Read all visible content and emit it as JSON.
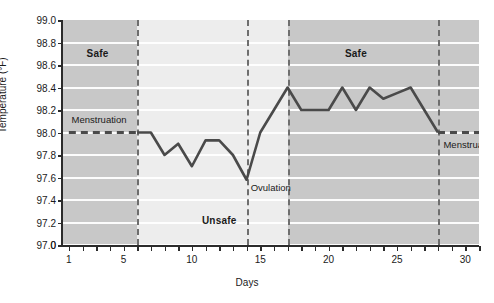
{
  "chart_data": {
    "type": "line",
    "title": "",
    "xlabel": "Days",
    "ylabel": "Temperature (°F)",
    "xlim": [
      0.5,
      31
    ],
    "ylim": [
      97.0,
      99.0
    ],
    "grid": true,
    "legend": "none",
    "y_axis_break_label": "0",
    "ytick_labels": [
      "99.0",
      "98.8",
      "98.6",
      "98.4",
      "98.2",
      "98.0",
      "97.8",
      "97.6",
      "97.4",
      "97.2",
      "97.0",
      "0"
    ],
    "ytick_values": [
      99.0,
      98.8,
      98.6,
      98.4,
      98.2,
      98.0,
      97.8,
      97.6,
      97.4,
      97.2,
      97.0
    ],
    "xtick_labels": [
      "1",
      "5",
      "10",
      "15",
      "20",
      "25",
      "30"
    ],
    "xtick_values": [
      1,
      5,
      10,
      15,
      20,
      25,
      30
    ],
    "x": [
      1,
      2,
      3,
      4,
      5,
      6,
      7,
      8,
      9,
      10,
      11,
      12,
      13,
      14,
      15,
      16,
      17,
      18,
      19,
      20,
      21,
      22,
      23,
      24,
      25,
      26,
      27,
      28,
      29,
      30,
      31
    ],
    "series": [
      {
        "name": "Basal body temperature",
        "style": "dashed",
        "segment": "menstruation-start",
        "x": [
          1,
          2,
          3,
          4,
          5,
          6
        ],
        "values": [
          98.0,
          98.0,
          98.0,
          98.0,
          98.0,
          98.0
        ]
      },
      {
        "name": "Basal body temperature",
        "style": "solid",
        "segment": "cycle",
        "x": [
          6,
          7,
          8,
          9,
          10,
          11,
          12,
          13,
          14,
          15,
          16,
          17,
          18,
          19,
          20,
          21,
          22,
          23,
          24,
          25,
          26,
          27,
          28
        ],
        "values": [
          98.0,
          98.0,
          97.8,
          97.9,
          97.7,
          97.93,
          97.93,
          97.8,
          97.58,
          98.0,
          98.2,
          98.4,
          98.2,
          98.2,
          98.2,
          98.4,
          98.2,
          98.4,
          98.3,
          98.35,
          98.4,
          98.2,
          98.0
        ]
      },
      {
        "name": "Basal body temperature",
        "style": "dashed",
        "segment": "menstruation-end",
        "x": [
          28,
          29,
          30,
          31
        ],
        "values": [
          98.0,
          98.0,
          98.0,
          98.0
        ]
      }
    ],
    "phase_bands": [
      {
        "label": "Safe",
        "x_start": 0.5,
        "x_end": 6.0,
        "shade": "dark",
        "color": "#c8c8c8"
      },
      {
        "label": "Unsafe",
        "x_start": 6.0,
        "x_end": 17.0,
        "shade": "light",
        "color": "#ededed"
      },
      {
        "label": "Safe",
        "x_start": 17.0,
        "x_end": 31.0,
        "shade": "dark",
        "color": "#c8c8c8"
      }
    ],
    "dividers": [
      {
        "name": "divider-day-6",
        "x": 6.0
      },
      {
        "name": "divider-day-14",
        "x": 14.0
      },
      {
        "name": "divider-day-17",
        "x": 17.0
      },
      {
        "name": "divider-day-28",
        "x": 28.0
      }
    ],
    "annotations": [
      {
        "name": "menstruation-start-label",
        "text": "Menstruation",
        "x": 1.2,
        "y": 98.12
      },
      {
        "name": "ovulation-label",
        "text": "Ovulation",
        "x": 14.3,
        "y": 97.52
      },
      {
        "name": "menstruation-end-label",
        "text": "Menstruation",
        "x": 28.4,
        "y": 97.9
      }
    ],
    "band_labels": [
      {
        "name": "band-label-safe-left",
        "text": "Safe",
        "x": 3.1,
        "y": 98.71
      },
      {
        "name": "band-label-unsafe",
        "text": "Unsafe",
        "x": 12.0,
        "y": 97.22
      },
      {
        "name": "band-label-safe-right",
        "text": "Safe",
        "x": 22.0,
        "y": 98.71
      }
    ],
    "colors": {
      "line": "#4a4a4a",
      "band_dark": "#c8c8c8",
      "band_light": "#ededed",
      "gridline": "#ffffff",
      "divider": "#6e6e6e",
      "axis": "#2b2b2b",
      "text": "#1a1a1a"
    }
  }
}
